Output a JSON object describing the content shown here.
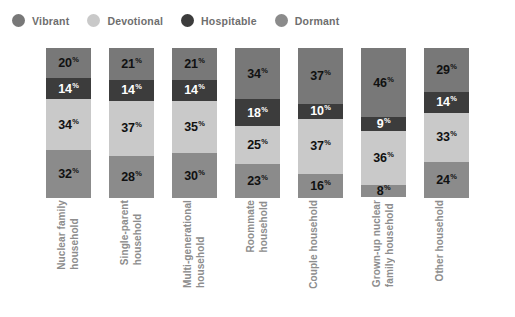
{
  "legend": {
    "position": "top-left",
    "items": [
      {
        "label": "Vibrant",
        "color": "#787878",
        "icon": "circle-icon"
      },
      {
        "label": "Devotional",
        "color": "#c9c9c9",
        "icon": "circle-icon"
      },
      {
        "label": "Hospitable",
        "color": "#3c3c3c",
        "icon": "circle-icon"
      },
      {
        "label": "Dormant",
        "color": "#8b8b8b",
        "icon": "circle-icon"
      }
    ]
  },
  "chart_data": {
    "type": "bar",
    "subtype": "stacked-bar-100",
    "title": "",
    "xlabel": "",
    "ylabel": "",
    "ylim": [
      0,
      100
    ],
    "grid": false,
    "value_suffix": "%",
    "categories": [
      "Nuclear family\nhousehold",
      "Single-parent\nhousehold",
      "Multi-generational\nhousehold",
      "Roommate\nhousehold",
      "Couple household",
      "Grown-up nuclear\nfamily household",
      "Other household"
    ],
    "series": [
      {
        "name": "Vibrant",
        "color": "#787878",
        "text_color": "#111111",
        "values": [
          20,
          21,
          21,
          34,
          37,
          46,
          29
        ]
      },
      {
        "name": "Hospitable",
        "color": "#3c3c3c",
        "text_color": "#ffffff",
        "values": [
          14,
          14,
          14,
          18,
          10,
          9,
          14
        ]
      },
      {
        "name": "Devotional",
        "color": "#c9c9c9",
        "text_color": "#111111",
        "values": [
          34,
          37,
          35,
          25,
          37,
          36,
          33
        ]
      },
      {
        "name": "Dormant",
        "color": "#8b8b8b",
        "text_color": "#111111",
        "values": [
          32,
          28,
          30,
          23,
          16,
          8,
          24
        ]
      }
    ]
  },
  "layout": {
    "bar_left_positions": [
      46,
      109,
      172,
      235,
      298,
      361,
      424
    ],
    "bar_width": 45
  }
}
